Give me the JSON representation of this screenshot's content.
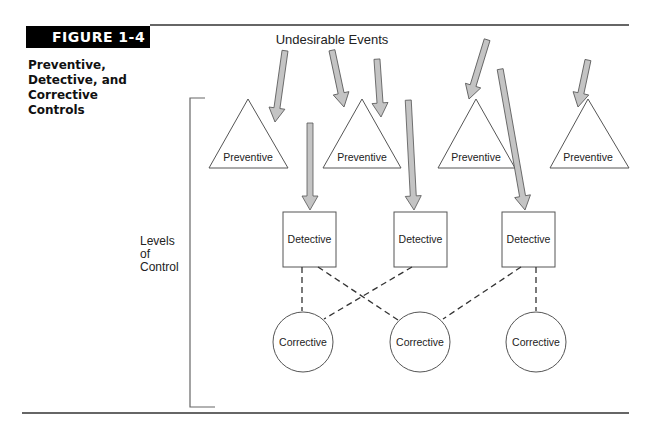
{
  "figure": {
    "badge": "FIGURE 1-4",
    "caption_line1": "Preventive,",
    "caption_line2": "Detective, and",
    "caption_line3": "Corrective Controls"
  },
  "diagram": {
    "title": "Undesirable Events",
    "axis_label_line1": "Levels",
    "axis_label_line2": "of",
    "axis_label_line3": "Control",
    "preventive_nodes": [
      {
        "label": "Preventive"
      },
      {
        "label": "Preventive"
      },
      {
        "label": "Preventive"
      },
      {
        "label": "Preventive"
      }
    ],
    "detective_nodes": [
      {
        "label": "Detective"
      },
      {
        "label": "Detective"
      },
      {
        "label": "Detective"
      }
    ],
    "corrective_nodes": [
      {
        "label": "Corrective"
      },
      {
        "label": "Corrective"
      },
      {
        "label": "Corrective"
      }
    ],
    "colors": {
      "arrow_fill": "#c4c4c4",
      "stroke": "#555555",
      "rule": "#333333"
    }
  }
}
